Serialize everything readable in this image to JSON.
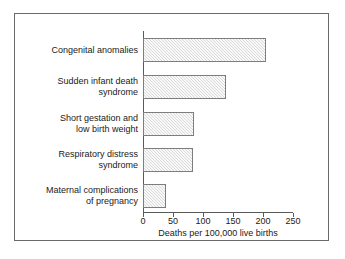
{
  "chart_data": {
    "type": "bar",
    "orientation": "horizontal",
    "title": "",
    "xlabel": "Deaths per 100,000 live births",
    "ylabel": "",
    "xlim": [
      0,
      250
    ],
    "xticks": [
      0,
      50,
      100,
      150,
      200,
      250
    ],
    "xtick_labels": [
      "0",
      "50",
      "100",
      "150",
      "200",
      "250"
    ],
    "grid": false,
    "legend": "none",
    "categories": [
      "Congenital anomalies",
      "Sudden infant death syndrome",
      "Short gestation and low birth weight",
      "Respiratory distress syndrome",
      "Maternal complications of pregnancy"
    ],
    "values": [
      205,
      139,
      85,
      83,
      38
    ],
    "bar_fill": "#d9d9d9",
    "bar_edge": "#7d7d7d",
    "axis_color": "#5a5a5a",
    "frame_color": "#6a6a6a",
    "background": "#ffffff"
  },
  "bars": [
    {
      "label_line1": "Congenital anomalies",
      "label_line2": "",
      "value": 205
    },
    {
      "label_line1": "Sudden infant death",
      "label_line2": "syndrome",
      "value": 139
    },
    {
      "label_line1": "Short gestation and",
      "label_line2": "low birth weight",
      "value": 85
    },
    {
      "label_line1": "Respiratory distress",
      "label_line2": "syndrome",
      "value": 83
    },
    {
      "label_line1": "Maternal complications",
      "label_line2": "of pregnancy",
      "value": 38
    }
  ],
  "axis": {
    "ticks": [
      "0",
      "50",
      "100",
      "150",
      "200",
      "250"
    ],
    "title": "Deaths per 100,000 live births"
  }
}
